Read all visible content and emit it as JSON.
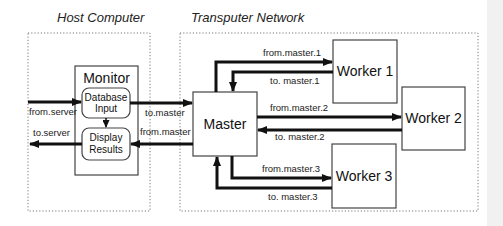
{
  "regions": {
    "host": {
      "title": "Host Computer"
    },
    "network": {
      "title": "Transputer Network"
    }
  },
  "nodes": {
    "monitor": {
      "label": "Monitor"
    },
    "database_input": {
      "line1": "Database",
      "line2": "Input"
    },
    "display_results": {
      "line1": "Display",
      "line2": "Results"
    },
    "master": {
      "label": "Master"
    },
    "worker1": {
      "label": "Worker 1"
    },
    "worker2": {
      "label": "Worker 2"
    },
    "worker3": {
      "label": "Worker 3"
    }
  },
  "channels": {
    "from_server": "from.server",
    "to_server": "to.server",
    "to_master": "to.master",
    "from_master": "from.master",
    "from_master_1": "from.master.1",
    "to_master_1": "to. master.1",
    "from_master_2": "from.master.2",
    "to_master_2": "to. master.2",
    "from_master_3": "from.master.3",
    "to_master_3": "to. master.3"
  }
}
